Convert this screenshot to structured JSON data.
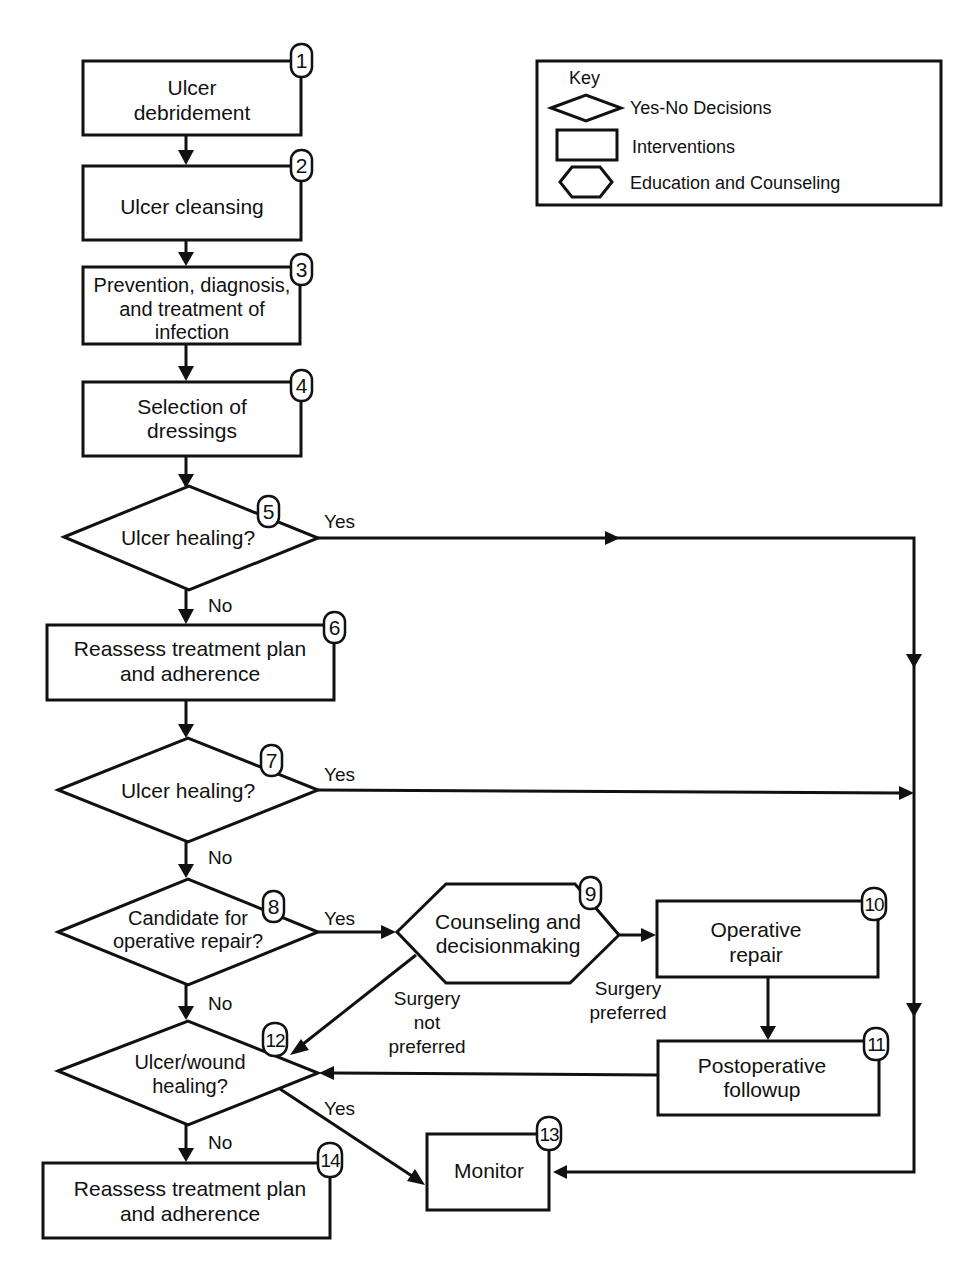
{
  "key": {
    "title": "Key",
    "items": [
      {
        "shape": "diamond",
        "label": "Yes-No Decisions"
      },
      {
        "shape": "rectangle",
        "label": "Interventions"
      },
      {
        "shape": "hexagon",
        "label": "Education and Counseling"
      }
    ]
  },
  "nodes": {
    "n1": {
      "number": "1",
      "type": "intervention",
      "lines": [
        "Ulcer",
        "debridement"
      ]
    },
    "n2": {
      "number": "2",
      "type": "intervention",
      "lines": [
        "Ulcer cleansing"
      ]
    },
    "n3": {
      "number": "3",
      "type": "intervention",
      "lines": [
        "Prevention, diagnosis,",
        "and treatment of",
        "infection"
      ]
    },
    "n4": {
      "number": "4",
      "type": "intervention",
      "lines": [
        "Selection of",
        "dressings"
      ]
    },
    "n5": {
      "number": "5",
      "type": "decision",
      "lines": [
        "Ulcer healing?"
      ]
    },
    "n6": {
      "number": "6",
      "type": "intervention",
      "lines": [
        "Reassess treatment plan",
        "and adherence"
      ]
    },
    "n7": {
      "number": "7",
      "type": "decision",
      "lines": [
        "Ulcer healing?"
      ]
    },
    "n8": {
      "number": "8",
      "type": "decision",
      "lines": [
        "Candidate for",
        "operative repair?"
      ]
    },
    "n9": {
      "number": "9",
      "type": "education",
      "lines": [
        "Counseling and",
        "decisionmaking"
      ]
    },
    "n10": {
      "number": "10",
      "type": "intervention",
      "lines": [
        "Operative",
        "repair"
      ]
    },
    "n11": {
      "number": "11",
      "type": "intervention",
      "lines": [
        "Postoperative",
        "followup"
      ]
    },
    "n12": {
      "number": "12",
      "type": "decision",
      "lines": [
        "Ulcer/wound",
        "healing?"
      ]
    },
    "n13": {
      "number": "13",
      "type": "intervention",
      "lines": [
        "Monitor"
      ]
    },
    "n14": {
      "number": "14",
      "type": "intervention",
      "lines": [
        "Reassess treatment plan",
        "and adherence"
      ]
    }
  },
  "edges": {
    "e5_yes": "Yes",
    "e5_no": "No",
    "e7_yes": "Yes",
    "e7_no": "No",
    "e8_yes": "Yes",
    "e8_no": "No",
    "e9_not_preferred": [
      "Surgery",
      "not",
      "preferred"
    ],
    "e9_preferred": [
      "Surgery",
      "preferred"
    ],
    "e12_yes": "Yes",
    "e12_no": "No"
  },
  "colors": {
    "ink": "#111111",
    "background": "#ffffff"
  }
}
